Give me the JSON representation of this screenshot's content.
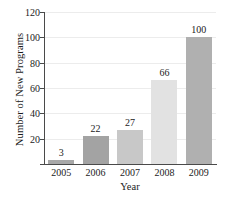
{
  "chart_data": {
    "type": "bar",
    "title": "",
    "xlabel": "Year",
    "ylabel": "Number of New Programs",
    "categories": [
      "2005",
      "2006",
      "2007",
      "2008",
      "2009"
    ],
    "values": [
      3,
      22,
      27,
      66,
      100
    ],
    "value_labels": [
      "3",
      "22",
      "27",
      "66",
      "100"
    ],
    "ylim": [
      0,
      120
    ],
    "yticks": [
      0,
      20,
      40,
      60,
      80,
      100,
      120
    ],
    "ytick_labels": [
      "120",
      "100",
      "80",
      "60",
      "40",
      "20"
    ],
    "grid": "horizontal",
    "legend": "none",
    "bar_colors": [
      "#a8a8a8",
      "#a3a3a3",
      "#c8c8c8",
      "#e2e2e2",
      "#b0b0b0"
    ],
    "axis_color": "#4a4a4a",
    "grid_color": "#ececec",
    "background": "#ffffff"
  }
}
